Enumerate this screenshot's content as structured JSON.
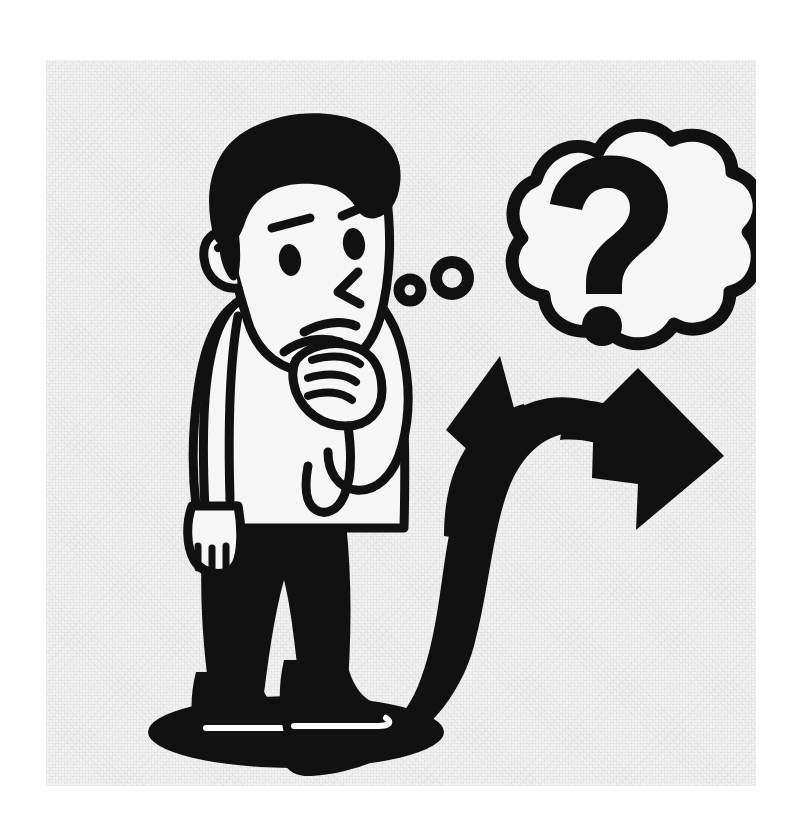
{
  "image": {
    "kind": "illustration",
    "title": "Thinking man facing a forked decision arrow",
    "caption": "",
    "canvas": {
      "width": 793,
      "height": 817,
      "background": "#ffffff"
    },
    "panel": {
      "x": 46,
      "y": 60,
      "width": 710,
      "height": 726,
      "background": "#f3f3f3",
      "texture": "paper-grain",
      "border": "none"
    },
    "palette": {
      "ink": "#111111",
      "paper": "#f3f3f3",
      "page": "#ffffff",
      "shirt": "#f6f6f6",
      "skin": "#f6f6f6",
      "hair": "#111111",
      "pants": "#111111",
      "shoe": "#111111",
      "shadow": "#111111"
    },
    "style": {
      "line_style": "bold uniform black outline",
      "stroke_width_px": 9,
      "fill_mode": "flat two-tone (black ink on light paper)",
      "shading": "none"
    }
  },
  "elements": [
    {
      "id": "character",
      "label": "Thinking man",
      "notes": "Standing figure, head turned, hand to chin"
    },
    {
      "id": "hair",
      "label": "Hair",
      "notes": "Solid black swept-back hair with forehead swoop"
    },
    {
      "id": "face",
      "label": "Face",
      "notes": "Light skin, black outline, three-quarter view"
    },
    {
      "id": "eyebrow-left",
      "label": "Left eyebrow",
      "notes": "Short slanted stroke"
    },
    {
      "id": "eyebrow-right",
      "label": "Right eyebrow",
      "notes": "Short slanted stroke"
    },
    {
      "id": "eye-left",
      "label": "Left eye",
      "notes": "Small black oval"
    },
    {
      "id": "eye-right",
      "label": "Right eye",
      "notes": "Small black oval"
    },
    {
      "id": "nose",
      "label": "Nose",
      "notes": "Angular chevron stroke"
    },
    {
      "id": "mouth",
      "label": "Mouth",
      "notes": "Shallow downward curve, pensive"
    },
    {
      "id": "ear",
      "label": "Ear",
      "notes": "Rounded with inner curl"
    },
    {
      "id": "hand-chin",
      "label": "Hand at chin",
      "notes": "Curled fist resting under chin"
    },
    {
      "id": "hand-side",
      "label": "Hand at side",
      "notes": "Relaxed hand with four fingers"
    },
    {
      "id": "shirt",
      "label": "Long sleeve shirt",
      "notes": "Light shirt with black outline and sleeve seam"
    },
    {
      "id": "pants",
      "label": "Trousers",
      "notes": "Solid black"
    },
    {
      "id": "shoes",
      "label": "Shoes",
      "notes": "Black with white sole outline"
    },
    {
      "id": "shadow",
      "label": "Ground shadow",
      "notes": "Black ellipse under the figure"
    },
    {
      "id": "thought-bubble",
      "label": "Thought bubble",
      "notes": "Cloud outline with nine lobes"
    },
    {
      "id": "question-mark",
      "label": "Question mark",
      "notes": "Bold question mark inside the bubble"
    },
    {
      "id": "bubble-dot-1",
      "label": "Small thought ring",
      "notes": "Small ring nearest the face"
    },
    {
      "id": "bubble-dot-2",
      "label": "Medium thought ring",
      "notes": "Larger ring between face and bubble"
    },
    {
      "id": "fork-arrow",
      "label": "Forking decision arrow",
      "notes": "Single black path splitting into two arrowheads"
    },
    {
      "id": "arrowhead-up",
      "label": "Upper-left arrowhead",
      "notes": "Triangle pointing up and to the left"
    },
    {
      "id": "arrowhead-right",
      "label": "Right arrowhead",
      "notes": "Triangle pointing to the right"
    }
  ],
  "text_content": {
    "visible_strings": [
      "?"
    ],
    "question_mark_glyph": "?"
  }
}
